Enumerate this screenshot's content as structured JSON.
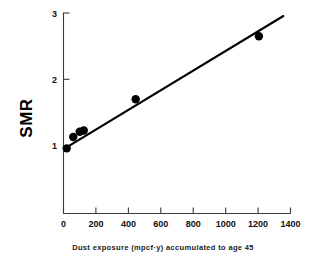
{
  "chart_data": {
    "type": "scatter",
    "title": "",
    "subtitle": "",
    "caption": "Dust exposure (mpcf·y) accumulated to age 45",
    "xlabel": "Dust exposure (mpcf·y) accumulated to age 45",
    "ylabel": "SMR",
    "xlim": [
      0,
      1400
    ],
    "ylim": [
      0,
      3
    ],
    "y_axis_visible_range": [
      0,
      3
    ],
    "grid": false,
    "legend": null,
    "legend_position": "none",
    "xticks": [
      0,
      200,
      400,
      600,
      800,
      1000,
      1200,
      1400
    ],
    "xticklabels": [
      "0",
      "200",
      "400",
      "600",
      "800",
      "1000",
      "1200",
      "1400"
    ],
    "yticks": [
      1,
      2,
      3
    ],
    "yticklabels": [
      "1",
      "2",
      "3"
    ],
    "marker": "filled-circle",
    "marker_color": "#000000",
    "points": [
      {
        "x": 20,
        "y": 0.96,
        "label": ""
      },
      {
        "x": 60,
        "y": 1.13,
        "label": ""
      },
      {
        "x": 100,
        "y": 1.21,
        "label": ""
      },
      {
        "x": 125,
        "y": 1.23,
        "label": ""
      },
      {
        "x": 445,
        "y": 1.7,
        "label": ""
      },
      {
        "x": 1205,
        "y": 2.65,
        "label": ""
      }
    ],
    "series": [
      {
        "name": "SMR by dust exposure",
        "x": [
          20,
          60,
          100,
          125,
          445,
          1205
        ],
        "values": [
          0.96,
          1.13,
          1.21,
          1.23,
          1.7,
          2.65
        ]
      }
    ],
    "fit_line": {
      "type": "linear-regression",
      "x_start": 6,
      "y_start": 0.955,
      "x_end": 1356,
      "y_end": 2.955,
      "slope_per_unit": 0.001481,
      "intercept": 0.946,
      "color": "#000000"
    }
  },
  "axes": {
    "y_axis_name": "SMR",
    "x_axis_caption": "Dust exposure (mpcf·y) accumulated to age 45"
  }
}
